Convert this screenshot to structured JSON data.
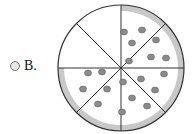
{
  "option": {
    "label": "B.",
    "selected": false
  },
  "figure": {
    "type": "pizza-fraction",
    "total_slices": 8,
    "remaining_slices": 6,
    "missing_slices": 2,
    "colors": {
      "crust": "#c8c8c8",
      "pepperoni": "#8a8a8a",
      "outline": "#333333"
    }
  }
}
